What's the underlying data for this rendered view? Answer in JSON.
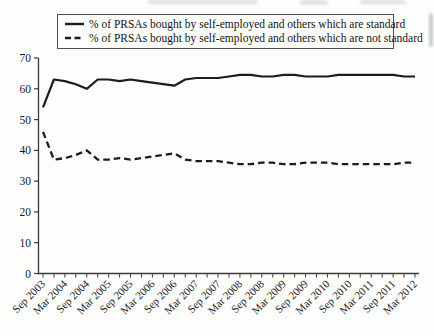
{
  "page": {
    "background": "#fdfdfc"
  },
  "chart_data": {
    "type": "line",
    "title": "",
    "xlabel": "",
    "ylabel": "",
    "grid": false,
    "legend_position": "top",
    "axis_color": "#3a3a3a",
    "ylim": [
      0,
      70
    ],
    "yticks": [
      0,
      10,
      20,
      30,
      40,
      50,
      60,
      70
    ],
    "points_per_label": 2,
    "x_tick_labels": [
      "Sep 2003",
      "Mar 2004",
      "Sep 2004",
      "Mar 2005",
      "Sep 2005",
      "Mar 2006",
      "Sep 2006",
      "Mar 2007",
      "Sep 2007",
      "Mar 2008",
      "Sep 2008",
      "Mar 2009",
      "Sep 2009",
      "Mar 2010",
      "Sep 2010",
      "Mar 2011",
      "Sep 2011",
      "Mar 2012"
    ],
    "series": [
      {
        "name": "% of PRSAs bought by self-employed and others which are standard",
        "style": "solid",
        "color": "#1c1c1c",
        "values": [
          54,
          63,
          62.5,
          61.5,
          60,
          63,
          63,
          62.5,
          63,
          62.5,
          62,
          61.5,
          61,
          63,
          63.5,
          63.5,
          63.5,
          64,
          64.5,
          64.5,
          64,
          64,
          64.5,
          64.5,
          64,
          64,
          64,
          64.5,
          64.5,
          64.5,
          64.5,
          64.5,
          64.5,
          64,
          64
        ]
      },
      {
        "name": "% of PRSAs bought by self-employed and others which are not standard",
        "style": "dashed",
        "color": "#1c1c1c",
        "values": [
          46,
          37,
          37.5,
          38.5,
          40,
          37,
          37,
          37.5,
          37,
          37.5,
          38,
          38.5,
          39,
          37,
          36.5,
          36.5,
          36.5,
          36,
          35.5,
          35.5,
          36,
          36,
          35.5,
          35.5,
          36,
          36,
          36,
          35.5,
          35.5,
          35.5,
          35.5,
          35.5,
          35.5,
          36,
          36
        ]
      }
    ]
  }
}
